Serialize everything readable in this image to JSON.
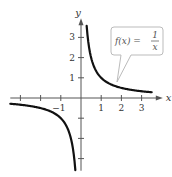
{
  "chart_data": {
    "type": "line",
    "title": "",
    "function_label": "f(x) = 1/x",
    "callout": {
      "lhs": "f(x) =",
      "numerator": "1",
      "denominator": "x"
    },
    "xlabel": "x",
    "ylabel": "y",
    "xlim": [
      -3.5,
      4
    ],
    "ylim": [
      -3.6,
      3.9
    ],
    "x_ticks": [
      -3,
      -2,
      -1,
      1,
      2,
      3
    ],
    "x_tick_labels": {
      "-1": "−1",
      "1": "1",
      "2": "2",
      "3": "3"
    },
    "y_ticks": [
      -3,
      -2,
      -1,
      1,
      2,
      3
    ],
    "y_tick_labels": {
      "1": "1",
      "2": "2",
      "3": "3"
    },
    "grid": false,
    "series": [
      {
        "name": "f(x) = 1/x (x > 0)",
        "x": [
          0.28,
          0.33,
          0.4,
          0.5,
          0.75,
          1,
          1.5,
          2,
          2.5,
          3,
          3.5
        ],
        "y": [
          3.57,
          3.03,
          2.5,
          2.0,
          1.33,
          1.0,
          0.67,
          0.5,
          0.4,
          0.33,
          0.29
        ]
      },
      {
        "name": "f(x) = 1/x (x < 0)",
        "x": [
          -3.5,
          -3,
          -2.5,
          -2,
          -1.5,
          -1,
          -0.75,
          -0.5,
          -0.4,
          -0.33,
          -0.28
        ],
        "y": [
          -0.29,
          -0.33,
          -0.4,
          -0.5,
          -0.67,
          -1.0,
          -1.33,
          -2.0,
          -2.5,
          -3.03,
          -3.57
        ]
      }
    ],
    "colors": {
      "curve": "#111111",
      "axis": "#555555",
      "callout_border": "#bbbbbb"
    }
  }
}
